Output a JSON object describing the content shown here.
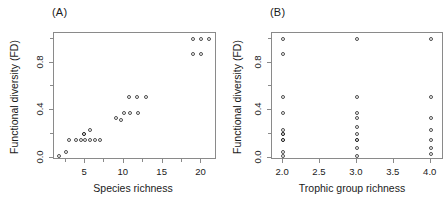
{
  "figure": {
    "panels": [
      {
        "tag": "(A)"
      },
      {
        "tag": "(B)"
      }
    ]
  },
  "chart_data": [
    {
      "type": "scatter",
      "panel": "(A)",
      "title": "",
      "xlabel": "Species richness",
      "ylabel": "Functional diversity (FD)",
      "xlim": [
        1,
        22
      ],
      "ylim": [
        -0.02,
        1.05
      ],
      "xticks": [
        5,
        10,
        15,
        20
      ],
      "xtick_labels": [
        "5",
        "10",
        "15",
        "20"
      ],
      "xticks_minor": [
        2.5,
        7.5,
        12.5,
        17.5
      ],
      "yticks": [
        0.0,
        0.4,
        0.8
      ],
      "ytick_labels": [
        "0.0",
        "0.4",
        "0.8"
      ],
      "yticks_minor": [
        0.2,
        0.6,
        1.0
      ],
      "grid": false,
      "legend": "none",
      "marker": "open-circle",
      "points": [
        {
          "x": 1.6,
          "y": 0.01
        },
        {
          "x": 2.6,
          "y": 0.05
        },
        {
          "x": 2.9,
          "y": 0.15
        },
        {
          "x": 3.8,
          "y": 0.15
        },
        {
          "x": 4.5,
          "y": 0.15
        },
        {
          "x": 4.9,
          "y": 0.2,
          "emphasis": true
        },
        {
          "x": 5.0,
          "y": 0.15
        },
        {
          "x": 5.6,
          "y": 0.23
        },
        {
          "x": 5.7,
          "y": 0.15
        },
        {
          "x": 6.3,
          "y": 0.15
        },
        {
          "x": 6.9,
          "y": 0.15
        },
        {
          "x": 9.0,
          "y": 0.33
        },
        {
          "x": 9.6,
          "y": 0.32
        },
        {
          "x": 10.0,
          "y": 0.38
        },
        {
          "x": 10.7,
          "y": 0.51
        },
        {
          "x": 10.8,
          "y": 0.38
        },
        {
          "x": 11.7,
          "y": 0.51
        },
        {
          "x": 11.8,
          "y": 0.38
        },
        {
          "x": 12.8,
          "y": 0.51
        },
        {
          "x": 18.9,
          "y": 1.0
        },
        {
          "x": 18.9,
          "y": 0.87
        },
        {
          "x": 19.9,
          "y": 1.0
        },
        {
          "x": 19.9,
          "y": 0.87
        },
        {
          "x": 21.0,
          "y": 1.0
        }
      ]
    },
    {
      "type": "scatter",
      "panel": "(B)",
      "title": "",
      "xlabel": "Trophic group richness",
      "ylabel": "Functional diversity (FD)",
      "xlim": [
        1.85,
        4.18
      ],
      "ylim": [
        -0.02,
        1.05
      ],
      "xticks": [
        2.0,
        2.5,
        3.0,
        3.5,
        4.0
      ],
      "xtick_labels": [
        "2.0",
        "2.5",
        "3.0",
        "3.5",
        "4.0"
      ],
      "xticks_minor": [],
      "yticks": [
        0.0,
        0.4,
        0.8
      ],
      "ytick_labels": [
        "0.0",
        "0.4",
        "0.8"
      ],
      "yticks_minor": [
        0.2,
        0.6,
        1.0
      ],
      "grid": false,
      "legend": "none",
      "marker": "open-circle",
      "points": [
        {
          "x": 2.0,
          "y": 1.0
        },
        {
          "x": 2.0,
          "y": 0.87
        },
        {
          "x": 2.0,
          "y": 0.51
        },
        {
          "x": 2.0,
          "y": 0.38
        },
        {
          "x": 2.0,
          "y": 0.23
        },
        {
          "x": 2.0,
          "y": 0.2,
          "emphasis": true
        },
        {
          "x": 2.0,
          "y": 0.15,
          "emphasis": true
        },
        {
          "x": 2.0,
          "y": 0.05
        },
        {
          "x": 2.0,
          "y": 0.01
        },
        {
          "x": 3.0,
          "y": 1.0
        },
        {
          "x": 3.0,
          "y": 0.51
        },
        {
          "x": 3.0,
          "y": 0.38
        },
        {
          "x": 3.0,
          "y": 0.33
        },
        {
          "x": 3.0,
          "y": 0.26
        },
        {
          "x": 3.0,
          "y": 0.2
        },
        {
          "x": 3.0,
          "y": 0.15,
          "emphasis": true
        },
        {
          "x": 3.0,
          "y": 0.08
        },
        {
          "x": 3.0,
          "y": 0.01
        },
        {
          "x": 4.0,
          "y": 1.0
        },
        {
          "x": 4.0,
          "y": 0.51
        },
        {
          "x": 4.0,
          "y": 0.33
        },
        {
          "x": 4.0,
          "y": 0.23
        },
        {
          "x": 4.0,
          "y": 0.15
        },
        {
          "x": 4.0,
          "y": 0.08
        },
        {
          "x": 4.0,
          "y": 0.03
        }
      ]
    }
  ]
}
